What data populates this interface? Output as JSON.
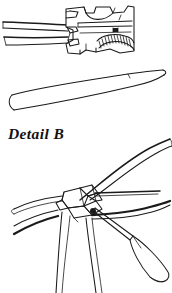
{
  "page": {
    "width": 172,
    "height": 293,
    "background_color": "#ffffff",
    "ink_color": "#1a1a1a",
    "media": "scanned line-art technical illustration"
  },
  "caption": {
    "text": "Detail B",
    "style": "bold italic serif"
  },
  "figures": [
    {
      "id": "fig-top-clamp",
      "name": "swage-clamp-with-rope",
      "description": "Cutaway side view of a metal clamp / swage fitting body with a saddle notch on top, internal channel, a small pin mark, and a curved serrated (hatched) gripping jaw; two tapered rope strands enter from the left.",
      "parts": [
        "clamp-body",
        "top-saddle-notch",
        "internal-channel",
        "pin-mark",
        "serrated-jaw",
        "upper-rope-strand",
        "lower-rope-strand"
      ]
    },
    {
      "id": "fig-middle-strand",
      "name": "tapered-strand",
      "description": "A long, gently curved, tapered strand or wedge shown in isolation, wide at the left end and narrowing toward the right tip."
    },
    {
      "id": "fig-bottom-splice",
      "name": "splice-knot-with-fid",
      "description": "Close-up of rope strands woven into a splice/knot at the centre, with strands radiating out; a fid (marlinspike) with a tapered handle is inserted into the knot from the lower right.",
      "parts": [
        "knot-core",
        "sweeping-upper-strand",
        "left-strands",
        "right-strands",
        "trailing-lower-strands",
        "fid-tool",
        "fid-handle",
        "fid-spike"
      ]
    }
  ]
}
